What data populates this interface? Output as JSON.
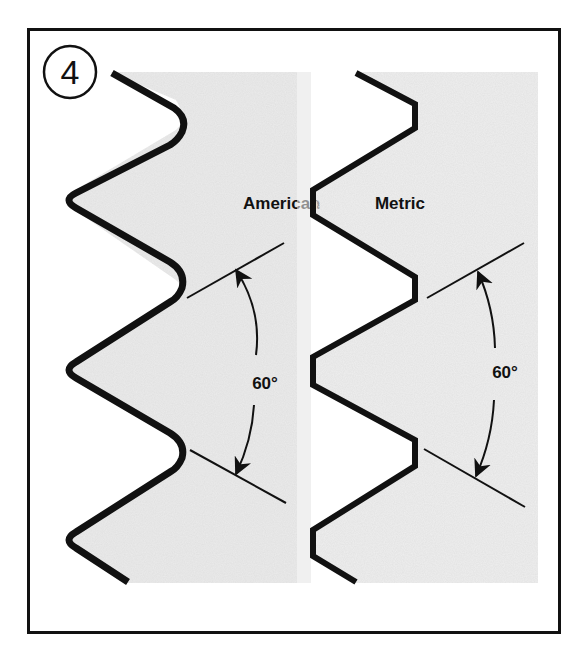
{
  "figure": {
    "number": "4",
    "panels": [
      {
        "id": "american",
        "title": "American",
        "angle_label": "60°",
        "crest_style": "rounded"
      },
      {
        "id": "metric",
        "title": "Metric",
        "angle_label": "60°",
        "crest_style": "flat"
      }
    ]
  },
  "colors": {
    "frame": "#111111",
    "thread_outline": "#111111",
    "panel_fill": "#d9d9d9",
    "background": "#ffffff"
  }
}
